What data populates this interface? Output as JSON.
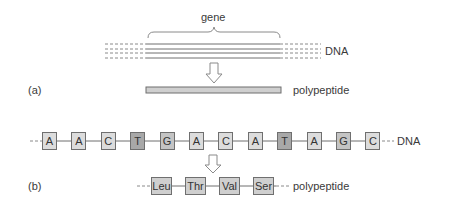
{
  "panel_a": {
    "label": "(a)",
    "gene_label": "gene",
    "dna_label": "DNA",
    "polypeptide_label": "polypeptide"
  },
  "panel_b": {
    "label": "(b)",
    "dna_label": "DNA",
    "polypeptide_label": "polypeptide",
    "nucleotides": [
      "A",
      "A",
      "C",
      "T",
      "G",
      "A",
      "C",
      "A",
      "T",
      "A",
      "G",
      "C"
    ],
    "nucleotide_shades": [
      "light",
      "light",
      "light",
      "dark",
      "mid",
      "light",
      "light",
      "light",
      "dark",
      "light",
      "mid",
      "light"
    ],
    "amino_acids": [
      "Leu",
      "Thr",
      "Val",
      "Ser"
    ]
  },
  "colors": {
    "light": "#dcdcdc",
    "mid": "#c4c4c4",
    "dark": "#a8a8a8",
    "amino": "#cfcfcf",
    "line": "#6f6f6f"
  }
}
